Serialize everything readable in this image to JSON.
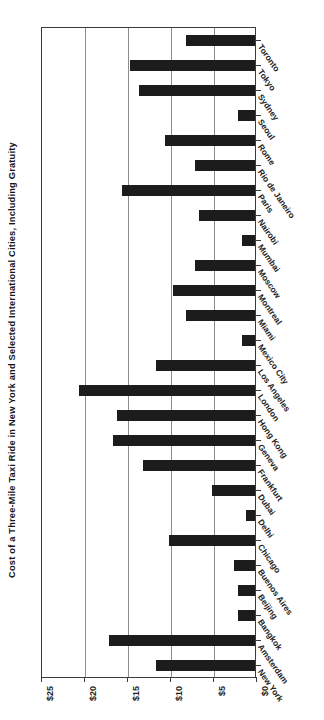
{
  "chart_data": {
    "type": "bar",
    "orientation": "horizontal",
    "title": "Cost of a Three-Mile Taxi Ride in New York and Selected International Cities, Including Gratuity",
    "xlabel": "",
    "ylabel": "",
    "xlim": [
      0,
      25
    ],
    "xticks": [
      0,
      5,
      10,
      15,
      20,
      25
    ],
    "xtick_labels": [
      "$0",
      "$5",
      "$10",
      "$15",
      "$20",
      "$25"
    ],
    "grid": true,
    "grid_axis": "x",
    "legend": false,
    "axis_direction": "value axis decreases left to right; $0 at right edge",
    "bar_color": "#1c1c1c",
    "gridline_color": "#8d8d8d",
    "axis_color": "#3b3b3b",
    "categories": [
      "Toronto",
      "Tokyo",
      "Sydney",
      "Seoul",
      "Rome",
      "Rio de Janeiro",
      "Paris",
      "Nairobi",
      "Mumbai",
      "Moscow",
      "Montreal",
      "Miami",
      "Mexico City",
      "Los Angeles",
      "London",
      "Hong Kong",
      "Geneva",
      "Frankfurt",
      "Dubai",
      "Delhi",
      "Chicago",
      "Buenos Aires",
      "Beijing",
      "Bangkok",
      "Amsterdam",
      "New York"
    ],
    "values": [
      8.0,
      14.5,
      13.5,
      2.0,
      10.5,
      7.0,
      15.5,
      6.5,
      1.5,
      7.0,
      9.5,
      8.0,
      1.5,
      11.5,
      20.5,
      16.0,
      16.5,
      13.0,
      5.0,
      1.0,
      10.0,
      2.5,
      2.0,
      2.0,
      17.0,
      11.5
    ]
  }
}
